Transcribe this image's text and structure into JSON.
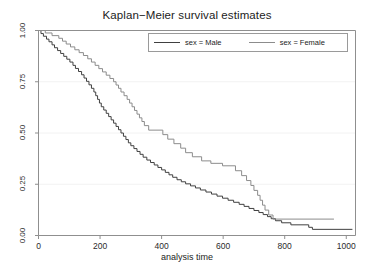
{
  "chart_data": {
    "type": "line",
    "subtype": "step-function",
    "title": "Kaplan−Meier survival estimates",
    "xlabel": "analysis time",
    "ylabel": "",
    "xlim": [
      0,
      1030
    ],
    "ylim": [
      0,
      1.0
    ],
    "grid": true,
    "grid_axis": "y",
    "legend_position": "top-right inside plot",
    "xticks": [
      0,
      200,
      400,
      600,
      800,
      1000
    ],
    "xtick_labels": [
      "0",
      "200",
      "400",
      "600",
      "800",
      "1000"
    ],
    "yticks": [
      0.0,
      0.25,
      0.5,
      0.75,
      1.0
    ],
    "ytick_labels": [
      "0.00",
      "0.25",
      "0.50",
      "0.75",
      "1.00"
    ],
    "series": [
      {
        "name": "sex = Male",
        "color": "#404040",
        "points": [
          [
            0,
            1.0
          ],
          [
            8,
            1.0
          ],
          [
            8,
            0.985
          ],
          [
            16,
            0.985
          ],
          [
            16,
            0.972
          ],
          [
            26,
            0.972
          ],
          [
            26,
            0.958
          ],
          [
            34,
            0.958
          ],
          [
            34,
            0.945
          ],
          [
            44,
            0.945
          ],
          [
            44,
            0.93
          ],
          [
            52,
            0.93
          ],
          [
            52,
            0.916
          ],
          [
            62,
            0.916
          ],
          [
            62,
            0.902
          ],
          [
            72,
            0.902
          ],
          [
            72,
            0.888
          ],
          [
            82,
            0.888
          ],
          [
            82,
            0.874
          ],
          [
            92,
            0.874
          ],
          [
            92,
            0.86
          ],
          [
            102,
            0.86
          ],
          [
            102,
            0.846
          ],
          [
            112,
            0.846
          ],
          [
            112,
            0.83
          ],
          [
            120,
            0.83
          ],
          [
            120,
            0.815
          ],
          [
            130,
            0.815
          ],
          [
            130,
            0.8
          ],
          [
            140,
            0.8
          ],
          [
            140,
            0.784
          ],
          [
            148,
            0.784
          ],
          [
            148,
            0.768
          ],
          [
            156,
            0.768
          ],
          [
            156,
            0.752
          ],
          [
            164,
            0.752
          ],
          [
            164,
            0.735
          ],
          [
            172,
            0.735
          ],
          [
            172,
            0.718
          ],
          [
            180,
            0.718
          ],
          [
            180,
            0.7
          ],
          [
            186,
            0.7
          ],
          [
            186,
            0.682
          ],
          [
            192,
            0.682
          ],
          [
            192,
            0.664
          ],
          [
            198,
            0.664
          ],
          [
            198,
            0.646
          ],
          [
            204,
            0.646
          ],
          [
            204,
            0.628
          ],
          [
            212,
            0.628
          ],
          [
            212,
            0.612
          ],
          [
            220,
            0.612
          ],
          [
            220,
            0.596
          ],
          [
            228,
            0.596
          ],
          [
            228,
            0.58
          ],
          [
            236,
            0.58
          ],
          [
            236,
            0.564
          ],
          [
            244,
            0.564
          ],
          [
            244,
            0.548
          ],
          [
            252,
            0.548
          ],
          [
            252,
            0.532
          ],
          [
            260,
            0.532
          ],
          [
            260,
            0.516
          ],
          [
            268,
            0.516
          ],
          [
            268,
            0.5
          ],
          [
            276,
            0.5
          ],
          [
            276,
            0.484
          ],
          [
            284,
            0.484
          ],
          [
            284,
            0.468
          ],
          [
            292,
            0.468
          ],
          [
            292,
            0.452
          ],
          [
            300,
            0.452
          ],
          [
            300,
            0.438
          ],
          [
            310,
            0.438
          ],
          [
            310,
            0.424
          ],
          [
            320,
            0.424
          ],
          [
            320,
            0.41
          ],
          [
            330,
            0.41
          ],
          [
            330,
            0.396
          ],
          [
            340,
            0.396
          ],
          [
            340,
            0.382
          ],
          [
            352,
            0.382
          ],
          [
            352,
            0.368
          ],
          [
            364,
            0.368
          ],
          [
            364,
            0.356
          ],
          [
            376,
            0.356
          ],
          [
            376,
            0.344
          ],
          [
            388,
            0.344
          ],
          [
            388,
            0.332
          ],
          [
            400,
            0.332
          ],
          [
            400,
            0.32
          ],
          [
            412,
            0.32
          ],
          [
            412,
            0.308
          ],
          [
            424,
            0.308
          ],
          [
            424,
            0.296
          ],
          [
            436,
            0.296
          ],
          [
            436,
            0.284
          ],
          [
            450,
            0.284
          ],
          [
            450,
            0.272
          ],
          [
            464,
            0.272
          ],
          [
            464,
            0.262
          ],
          [
            478,
            0.262
          ],
          [
            478,
            0.252
          ],
          [
            494,
            0.252
          ],
          [
            494,
            0.242
          ],
          [
            510,
            0.242
          ],
          [
            510,
            0.232
          ],
          [
            526,
            0.232
          ],
          [
            526,
            0.222
          ],
          [
            544,
            0.222
          ],
          [
            544,
            0.212
          ],
          [
            562,
            0.212
          ],
          [
            562,
            0.202
          ],
          [
            580,
            0.202
          ],
          [
            580,
            0.192
          ],
          [
            598,
            0.192
          ],
          [
            598,
            0.182
          ],
          [
            616,
            0.182
          ],
          [
            616,
            0.172
          ],
          [
            634,
            0.172
          ],
          [
            634,
            0.162
          ],
          [
            652,
            0.162
          ],
          [
            652,
            0.152
          ],
          [
            668,
            0.152
          ],
          [
            668,
            0.142
          ],
          [
            684,
            0.142
          ],
          [
            684,
            0.132
          ],
          [
            700,
            0.132
          ],
          [
            700,
            0.122
          ],
          [
            716,
            0.122
          ],
          [
            716,
            0.112
          ],
          [
            730,
            0.112
          ],
          [
            730,
            0.102
          ],
          [
            744,
            0.102
          ],
          [
            744,
            0.092
          ],
          [
            756,
            0.092
          ],
          [
            756,
            0.082
          ],
          [
            770,
            0.082
          ],
          [
            770,
            0.072
          ],
          [
            790,
            0.072
          ],
          [
            790,
            0.062
          ],
          [
            820,
            0.062
          ],
          [
            820,
            0.052
          ],
          [
            878,
            0.052
          ],
          [
            878,
            0.04
          ],
          [
            890,
            0.04
          ],
          [
            890,
            0.03
          ],
          [
            1020,
            0.03
          ]
        ]
      },
      {
        "name": "sex = Female",
        "color": "#8c8c8c",
        "points": [
          [
            0,
            1.0
          ],
          [
            22,
            1.0
          ],
          [
            22,
            0.988
          ],
          [
            44,
            0.988
          ],
          [
            44,
            0.975
          ],
          [
            66,
            0.975
          ],
          [
            66,
            0.962
          ],
          [
            78,
            0.962
          ],
          [
            78,
            0.948
          ],
          [
            90,
            0.948
          ],
          [
            90,
            0.934
          ],
          [
            104,
            0.934
          ],
          [
            104,
            0.92
          ],
          [
            118,
            0.92
          ],
          [
            118,
            0.906
          ],
          [
            132,
            0.906
          ],
          [
            132,
            0.892
          ],
          [
            146,
            0.892
          ],
          [
            146,
            0.878
          ],
          [
            160,
            0.878
          ],
          [
            160,
            0.862
          ],
          [
            172,
            0.862
          ],
          [
            172,
            0.846
          ],
          [
            184,
            0.846
          ],
          [
            184,
            0.83
          ],
          [
            196,
            0.83
          ],
          [
            196,
            0.814
          ],
          [
            208,
            0.814
          ],
          [
            208,
            0.798
          ],
          [
            220,
            0.798
          ],
          [
            220,
            0.782
          ],
          [
            232,
            0.782
          ],
          [
            232,
            0.766
          ],
          [
            244,
            0.766
          ],
          [
            244,
            0.75
          ],
          [
            252,
            0.75
          ],
          [
            252,
            0.734
          ],
          [
            260,
            0.734
          ],
          [
            260,
            0.718
          ],
          [
            268,
            0.718
          ],
          [
            268,
            0.7
          ],
          [
            278,
            0.7
          ],
          [
            278,
            0.682
          ],
          [
            288,
            0.682
          ],
          [
            288,
            0.664
          ],
          [
            296,
            0.664
          ],
          [
            296,
            0.646
          ],
          [
            304,
            0.646
          ],
          [
            304,
            0.628
          ],
          [
            312,
            0.628
          ],
          [
            312,
            0.61
          ],
          [
            320,
            0.61
          ],
          [
            320,
            0.592
          ],
          [
            328,
            0.592
          ],
          [
            328,
            0.574
          ],
          [
            336,
            0.574
          ],
          [
            336,
            0.556
          ],
          [
            344,
            0.556
          ],
          [
            344,
            0.536
          ],
          [
            358,
            0.536
          ],
          [
            358,
            0.514
          ],
          [
            404,
            0.514
          ],
          [
            404,
            0.492
          ],
          [
            420,
            0.492
          ],
          [
            420,
            0.47
          ],
          [
            440,
            0.47
          ],
          [
            440,
            0.448
          ],
          [
            462,
            0.448
          ],
          [
            462,
            0.426
          ],
          [
            478,
            0.426
          ],
          [
            478,
            0.404
          ],
          [
            500,
            0.404
          ],
          [
            500,
            0.384
          ],
          [
            530,
            0.384
          ],
          [
            530,
            0.364
          ],
          [
            560,
            0.364
          ],
          [
            560,
            0.352
          ],
          [
            598,
            0.352
          ],
          [
            598,
            0.34
          ],
          [
            640,
            0.34
          ],
          [
            640,
            0.316
          ],
          [
            660,
            0.316
          ],
          [
            660,
            0.292
          ],
          [
            676,
            0.292
          ],
          [
            676,
            0.268
          ],
          [
            690,
            0.268
          ],
          [
            690,
            0.244
          ],
          [
            700,
            0.244
          ],
          [
            700,
            0.22
          ],
          [
            712,
            0.22
          ],
          [
            712,
            0.196
          ],
          [
            720,
            0.196
          ],
          [
            720,
            0.172
          ],
          [
            728,
            0.172
          ],
          [
            728,
            0.148
          ],
          [
            736,
            0.148
          ],
          [
            736,
            0.124
          ],
          [
            748,
            0.124
          ],
          [
            748,
            0.1
          ],
          [
            762,
            0.1
          ],
          [
            762,
            0.08
          ],
          [
            960,
            0.08
          ]
        ]
      }
    ],
    "annotations": [
      "Male survival falls below Female survival across the whole follow-up period.",
      "Female curve plateaus near 0.51 between time 358 and 404.",
      "Female curve is censored flat at 0.08 from time 762 to 960.",
      "Male curve ends near 0.03 at time 1020."
    ]
  },
  "legend": {
    "entries": [
      {
        "label": "sex = Male",
        "color": "#404040"
      },
      {
        "label": "sex = Female",
        "color": "#8c8c8c"
      }
    ]
  },
  "axes": {
    "frame_color": "#8f8f8f",
    "gridline_color": "#f2f2f2"
  }
}
